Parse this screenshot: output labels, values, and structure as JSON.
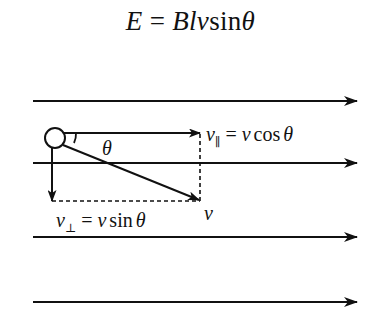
{
  "formula": {
    "lhs": "E",
    "eq": " = ",
    "vars": "Blv",
    "func": "sin",
    "angle": "θ"
  },
  "field_lines": {
    "count": 4,
    "y_positions": [
      101,
      163,
      237,
      302
    ],
    "x_start": 33,
    "x_end": 357,
    "direction": "right"
  },
  "particle": {
    "cx": 55,
    "cy": 138,
    "r": 10
  },
  "vectors": {
    "parallel": {
      "symbol": "v",
      "subscript": "∥",
      "eq": " = ",
      "rhs_var": "v",
      "rhs_func": "cos",
      "rhs_angle": "θ"
    },
    "perpendicular": {
      "symbol": "v",
      "subscript": "⊥",
      "eq": " = ",
      "rhs_var": "v",
      "rhs_func": "sin",
      "rhs_angle": "θ"
    },
    "resultant": {
      "symbol": "v"
    },
    "angle_label": "θ"
  },
  "colors": {
    "ink": "#111111",
    "background": "#ffffff"
  }
}
